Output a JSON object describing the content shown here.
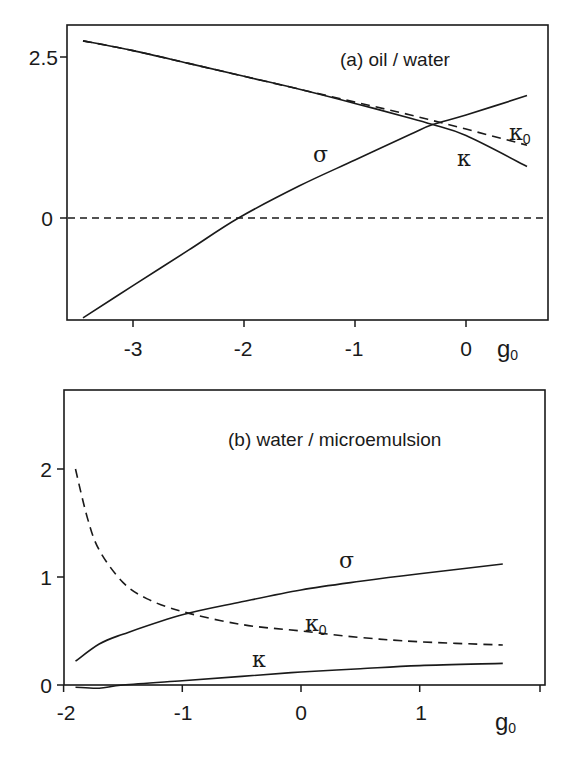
{
  "figure": {
    "panel_a": {
      "title": "(a) oil / water",
      "xlabel": "g",
      "xlabel_sub": "0",
      "x_ticks": [
        "-3",
        "-2",
        "-1",
        "0"
      ],
      "y_ticks": [
        "2.5",
        "0"
      ],
      "labels": {
        "sigma": "σ",
        "kappa": "κ",
        "kappa0": "κ",
        "kappa0_sub": "0"
      }
    },
    "panel_b": {
      "title": "(b) water / microemulsion",
      "xlabel": "g",
      "xlabel_sub": "0",
      "x_ticks": [
        "-2",
        "-1",
        "0",
        "1"
      ],
      "y_ticks": [
        "2",
        "1",
        "0"
      ],
      "labels": {
        "sigma": "σ",
        "kappa": "κ",
        "kappa0": "κ",
        "kappa0_sub": "0"
      }
    }
  },
  "chart_data": [
    {
      "type": "line",
      "title": "(a) oil / water",
      "xlabel": "g0",
      "ylabel": "",
      "xlim": [
        -3.6,
        0.75
      ],
      "ylim": [
        -1.6,
        3.0
      ],
      "x_ticks": [
        -3,
        -2,
        -1,
        0
      ],
      "y_ticks": [
        0,
        2.5
      ],
      "grid": false,
      "reference_line": {
        "y": 0,
        "style": "dashed"
      },
      "series": [
        {
          "name": "σ",
          "style": "solid",
          "x": [
            -3.45,
            -3.0,
            -2.5,
            -2.05,
            -1.5,
            -1.0,
            -0.5,
            -0.3,
            0.0,
            0.55
          ],
          "y": [
            -1.55,
            -1.05,
            -0.5,
            0.0,
            0.5,
            0.9,
            1.3,
            1.45,
            1.6,
            1.9
          ]
        },
        {
          "name": "κ",
          "style": "solid",
          "x": [
            -3.45,
            -3.0,
            -2.5,
            -2.0,
            -1.5,
            -1.0,
            -0.5,
            -0.3,
            0.0,
            0.55
          ],
          "y": [
            2.75,
            2.6,
            2.4,
            2.2,
            2.0,
            1.78,
            1.55,
            1.45,
            1.28,
            0.8
          ]
        },
        {
          "name": "κ0",
          "style": "dashed",
          "x": [
            -3.45,
            -3.0,
            -2.5,
            -2.0,
            -1.5,
            -1.0,
            -0.5,
            0.0,
            0.55
          ],
          "y": [
            2.75,
            2.6,
            2.4,
            2.2,
            2.0,
            1.8,
            1.6,
            1.38,
            1.13
          ]
        }
      ]
    },
    {
      "type": "line",
      "title": "(b) water / microemulsion",
      "xlabel": "g0",
      "ylabel": "",
      "xlim": [
        -2.0,
        2.05
      ],
      "ylim": [
        0.0,
        2.72
      ],
      "x_ticks": [
        -2,
        -1,
        0,
        1
      ],
      "y_ticks": [
        0,
        1,
        2
      ],
      "grid": false,
      "series": [
        {
          "name": "σ",
          "style": "solid",
          "x": [
            -1.9,
            -1.7,
            -1.5,
            -1.0,
            -0.5,
            0.0,
            0.5,
            1.0,
            1.7
          ],
          "y": [
            0.22,
            0.38,
            0.47,
            0.65,
            0.77,
            0.88,
            0.96,
            1.03,
            1.12
          ]
        },
        {
          "name": "κ0",
          "style": "dashed",
          "x": [
            -1.9,
            -1.8,
            -1.7,
            -1.5,
            -1.3,
            -1.0,
            -0.5,
            0.0,
            0.5,
            1.0,
            1.7
          ],
          "y": [
            2.0,
            1.55,
            1.25,
            0.95,
            0.8,
            0.68,
            0.56,
            0.5,
            0.44,
            0.4,
            0.37
          ]
        },
        {
          "name": "κ",
          "style": "solid",
          "x": [
            -1.9,
            -1.7,
            -1.5,
            -1.0,
            -0.5,
            0.0,
            0.5,
            1.0,
            1.7
          ],
          "y": [
            -0.02,
            -0.03,
            0.0,
            0.04,
            0.08,
            0.12,
            0.15,
            0.18,
            0.2
          ]
        }
      ]
    }
  ]
}
